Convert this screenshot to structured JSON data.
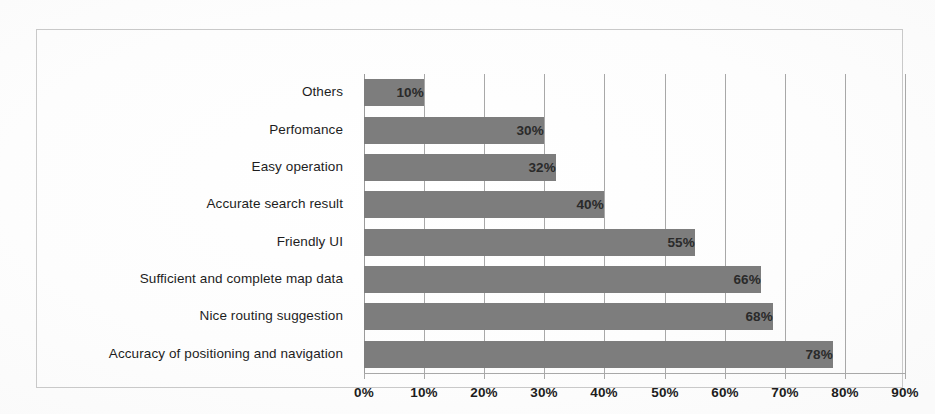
{
  "chart_data": {
    "type": "bar",
    "orientation": "horizontal",
    "title": "",
    "xlabel": "",
    "ylabel": "",
    "xlim": [
      0,
      90
    ],
    "xtick_labels": [
      "0%",
      "10%",
      "20%",
      "30%",
      "40%",
      "50%",
      "60%",
      "70%",
      "80%",
      "90%"
    ],
    "xticks": [
      0,
      10,
      20,
      30,
      40,
      50,
      60,
      70,
      80,
      90
    ],
    "grid": "vertical",
    "legend": "none",
    "categories": [
      "Others",
      "Perfomance",
      "Easy operation",
      "Accurate search result",
      "Friendly UI",
      "Sufficient and complete map data",
      "Nice routing suggestion",
      "Accuracy of positioning and navigation"
    ],
    "values": [
      10,
      30,
      32,
      40,
      55,
      66,
      68,
      78
    ],
    "data_labels": [
      "10%",
      "30%",
      "32%",
      "40%",
      "55%",
      "66%",
      "68%",
      "78%"
    ],
    "bar_color": "#7d7d7d",
    "gridline_color": "#a8a8a8",
    "frame_color": "#c9c9c9",
    "background_color": "#ffffff",
    "label_color": "#1d1d1d"
  }
}
